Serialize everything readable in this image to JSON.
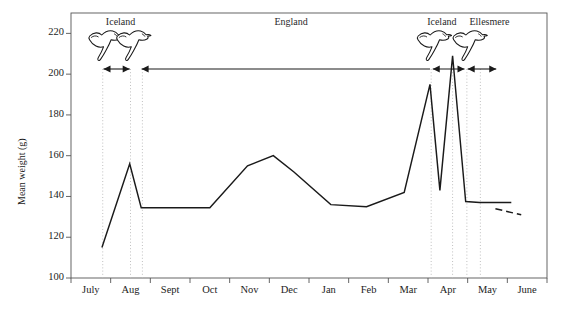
{
  "chart_data": {
    "type": "line",
    "title": "",
    "xlabel": "",
    "ylabel": "Mean weight (g)",
    "ylim": [
      100,
      230
    ],
    "yticks": [
      100,
      120,
      140,
      160,
      180,
      200,
      220
    ],
    "ytick_labels": [
      "100",
      "120",
      "140",
      "160",
      "180",
      "200",
      "220"
    ],
    "categories": [
      "July",
      "Aug",
      "Sept",
      "Oct",
      "Nov",
      "Dec",
      "Jan",
      "Feb",
      "Mar",
      "Apr",
      "May",
      "June"
    ],
    "grid": false,
    "legend": "none",
    "series": [
      {
        "name": "Mean weight",
        "style": "solid",
        "x": [
          0.78,
          1.48,
          1.77,
          3.5,
          4.45,
          5.1,
          5.62,
          6.55,
          7.45,
          8.4,
          9.05,
          9.3,
          9.62,
          9.95,
          10.3,
          10.55,
          11.1
        ],
        "values": [
          115,
          156,
          134.5,
          134.5,
          155,
          160,
          152,
          136,
          135,
          142,
          195,
          143,
          209,
          137.5,
          137,
          137,
          137
        ]
      },
      {
        "name": "Projected",
        "style": "dashed",
        "x": [
          10.7,
          11.35
        ],
        "values": [
          134,
          131
        ]
      }
    ],
    "annotations": {
      "regions": [
        {
          "label": "Iceland",
          "x_center": 1.25,
          "text_top": 16
        },
        {
          "label": "England",
          "x_center": 5.55,
          "text_top": 16
        },
        {
          "label": "Iceland",
          "x_center": 9.35,
          "text_top": 16
        },
        {
          "label": "Ellesmere",
          "x_center": 10.55,
          "text_top": 16
        }
      ],
      "birds": [
        {
          "name": "bird-icon-iceland-1",
          "x": 0.8
        },
        {
          "name": "bird-icon-iceland-2",
          "x": 1.5
        },
        {
          "name": "bird-icon-iceland-3",
          "x": 9.08
        },
        {
          "name": "bird-icon-ellesmere",
          "x": 9.98
        }
      ],
      "arrows": [
        {
          "name": "arrow-iceland-short",
          "from": 0.82,
          "to": 1.48,
          "double": true
        },
        {
          "name": "arrow-england-long",
          "from": 9.05,
          "to": 1.78,
          "double": false
        },
        {
          "name": "arrow-iceland-stay",
          "from": 9.12,
          "to": 9.92,
          "double": true
        },
        {
          "name": "arrow-ellesmere",
          "from": 10.0,
          "to": 10.72,
          "double": true
        }
      ],
      "dotted_verticals": [
        0.8,
        1.5,
        1.8,
        9.08,
        9.62,
        9.98,
        10.32
      ]
    },
    "colors": {
      "line": "#1a1a1a",
      "axis": "#555555",
      "dotted": "#b9b9b9",
      "text": "#1c1c1c",
      "background": "#ffffff"
    }
  }
}
